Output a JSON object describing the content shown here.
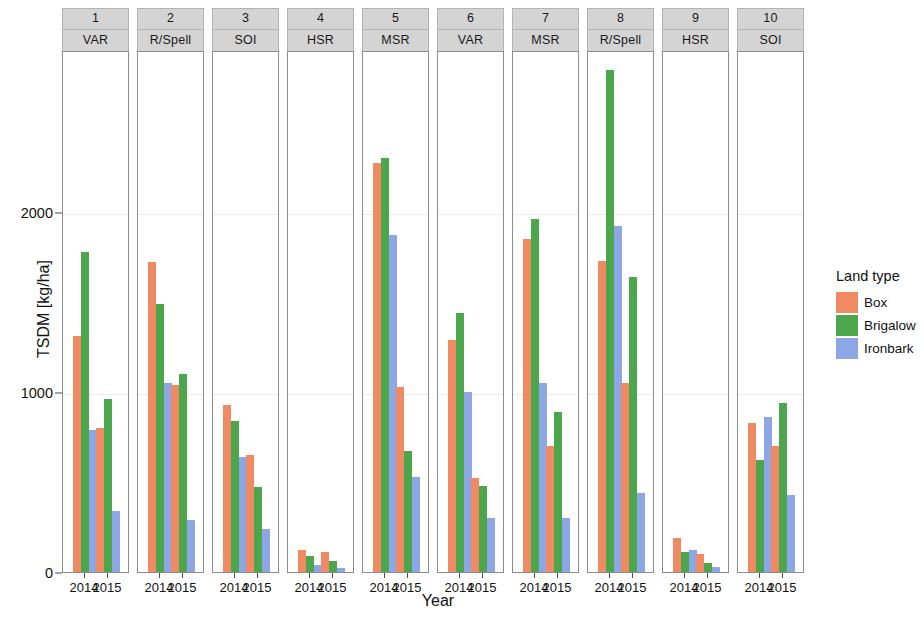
{
  "chart_data": {
    "type": "bar",
    "title": "",
    "xlabel": "Year",
    "ylabel": "TSDM [kg/ha]",
    "ylim": [
      0,
      2900
    ],
    "yticks": [
      0,
      1000,
      2000
    ],
    "ytick_labels": [
      "0",
      "1000",
      "2000"
    ],
    "grid": true,
    "x": [
      "2014",
      "2015"
    ],
    "categories": [
      "2014",
      "2015"
    ],
    "legend": {
      "title": "Land type",
      "position": "right",
      "entries": [
        {
          "name": "Box",
          "color": "#ef8a62"
        },
        {
          "name": "Brigalow",
          "color": "#4ca64c"
        },
        {
          "name": "Ironbark",
          "color": "#8da7e6"
        }
      ]
    },
    "facets": [
      {
        "strip_top": "1",
        "strip_bottom": "VAR",
        "series": [
          {
            "name": "Box",
            "color": "#ef8a62",
            "values": [
              1310,
              800
            ]
          },
          {
            "name": "Brigalow",
            "color": "#4ca64c",
            "values": [
              1780,
              960
            ]
          },
          {
            "name": "Ironbark",
            "color": "#8da7e6",
            "values": [
              790,
              340
            ]
          }
        ]
      },
      {
        "strip_top": "2",
        "strip_bottom": "R/Spell",
        "series": [
          {
            "name": "Box",
            "color": "#ef8a62",
            "values": [
              1720,
              1040
            ]
          },
          {
            "name": "Brigalow",
            "color": "#4ca64c",
            "values": [
              1490,
              1100
            ]
          },
          {
            "name": "Ironbark",
            "color": "#8da7e6",
            "values": [
              1050,
              290
            ]
          }
        ]
      },
      {
        "strip_top": "3",
        "strip_bottom": "SOI",
        "series": [
          {
            "name": "Box",
            "color": "#ef8a62",
            "values": [
              930,
              650
            ]
          },
          {
            "name": "Brigalow",
            "color": "#4ca64c",
            "values": [
              840,
              470
            ]
          },
          {
            "name": "Ironbark",
            "color": "#8da7e6",
            "values": [
              640,
              240
            ]
          }
        ]
      },
      {
        "strip_top": "4",
        "strip_bottom": "HSR",
        "series": [
          {
            "name": "Box",
            "color": "#ef8a62",
            "values": [
              120,
              110
            ]
          },
          {
            "name": "Brigalow",
            "color": "#4ca64c",
            "values": [
              90,
              60
            ]
          },
          {
            "name": "Ironbark",
            "color": "#8da7e6",
            "values": [
              40,
              25
            ]
          }
        ]
      },
      {
        "strip_top": "5",
        "strip_bottom": "MSR",
        "series": [
          {
            "name": "Box",
            "color": "#ef8a62",
            "values": [
              2270,
              1030
            ]
          },
          {
            "name": "Brigalow",
            "color": "#4ca64c",
            "values": [
              2300,
              670
            ]
          },
          {
            "name": "Ironbark",
            "color": "#8da7e6",
            "values": [
              1870,
              530
            ]
          }
        ]
      },
      {
        "strip_top": "6",
        "strip_bottom": "VAR",
        "series": [
          {
            "name": "Box",
            "color": "#ef8a62",
            "values": [
              1290,
              520
            ]
          },
          {
            "name": "Brigalow",
            "color": "#4ca64c",
            "values": [
              1440,
              480
            ]
          },
          {
            "name": "Ironbark",
            "color": "#8da7e6",
            "values": [
              1000,
              300
            ]
          }
        ]
      },
      {
        "strip_top": "7",
        "strip_bottom": "MSR",
        "series": [
          {
            "name": "Box",
            "color": "#ef8a62",
            "values": [
              1850,
              700
            ]
          },
          {
            "name": "Brigalow",
            "color": "#4ca64c",
            "values": [
              1960,
              890
            ]
          },
          {
            "name": "Ironbark",
            "color": "#8da7e6",
            "values": [
              1050,
              300
            ]
          }
        ]
      },
      {
        "strip_top": "8",
        "strip_bottom": "R/Spell",
        "series": [
          {
            "name": "Box",
            "color": "#ef8a62",
            "values": [
              1730,
              1050
            ]
          },
          {
            "name": "Brigalow",
            "color": "#4ca64c",
            "values": [
              2790,
              1640
            ]
          },
          {
            "name": "Ironbark",
            "color": "#8da7e6",
            "values": [
              1920,
              440
            ]
          }
        ]
      },
      {
        "strip_top": "9",
        "strip_bottom": "HSR",
        "series": [
          {
            "name": "Box",
            "color": "#ef8a62",
            "values": [
              190,
              100
            ]
          },
          {
            "name": "Brigalow",
            "color": "#4ca64c",
            "values": [
              110,
              50
            ]
          },
          {
            "name": "Ironbark",
            "color": "#8da7e6",
            "values": [
              120,
              30
            ]
          }
        ]
      },
      {
        "strip_top": "10",
        "strip_bottom": "SOI",
        "series": [
          {
            "name": "Box",
            "color": "#ef8a62",
            "values": [
              830,
              700
            ]
          },
          {
            "name": "Brigalow",
            "color": "#4ca64c",
            "values": [
              620,
              940
            ]
          },
          {
            "name": "Ironbark",
            "color": "#8da7e6",
            "values": [
              860,
              430
            ]
          }
        ]
      }
    ]
  }
}
